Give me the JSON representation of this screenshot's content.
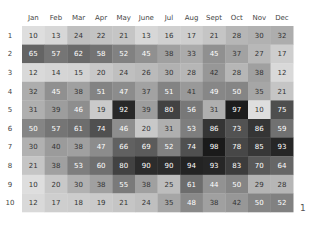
{
  "chart_data": {
    "type": "heatmap",
    "title": "",
    "xlabel": "",
    "ylabel": "",
    "x_categories": [
      "Jan",
      "Feb",
      "Mar",
      "Apr",
      "May",
      "June",
      "Jul",
      "Aug",
      "Sept",
      "Oct",
      "Nov",
      "Dec"
    ],
    "y_categories": [
      "1",
      "2",
      "3",
      "4",
      "5",
      "6",
      "7",
      "8",
      "9",
      "10"
    ],
    "values": [
      [
        10,
        13,
        24,
        22,
        21,
        13,
        16,
        17,
        21,
        28,
        30,
        32
      ],
      [
        65,
        57,
        62,
        58,
        52,
        45,
        38,
        33,
        45,
        37,
        27,
        17
      ],
      [
        12,
        14,
        15,
        20,
        24,
        26,
        30,
        28,
        42,
        28,
        38,
        12
      ],
      [
        32,
        45,
        38,
        51,
        47,
        37,
        51,
        41,
        49,
        50,
        35,
        21
      ],
      [
        31,
        39,
        46,
        19,
        92,
        39,
        80,
        56,
        31,
        97,
        10,
        75
      ],
      [
        50,
        57,
        61,
        74,
        46,
        20,
        31,
        53,
        86,
        73,
        86,
        59
      ],
      [
        30,
        40,
        38,
        47,
        66,
        69,
        52,
        74,
        98,
        78,
        85,
        93
      ],
      [
        21,
        38,
        53,
        60,
        80,
        90,
        90,
        94,
        93,
        83,
        70,
        64
      ],
      [
        10,
        20,
        30,
        38,
        55,
        38,
        25,
        61,
        44,
        50,
        29,
        28
      ],
      [
        12,
        17,
        18,
        19,
        21,
        24,
        35,
        48,
        38,
        42,
        50,
        52
      ]
    ],
    "color_range": [
      0,
      100
    ],
    "colormap": "grayscale (light = low, dark = high)",
    "grid": false,
    "legend": "none"
  },
  "corner_mark": "1"
}
